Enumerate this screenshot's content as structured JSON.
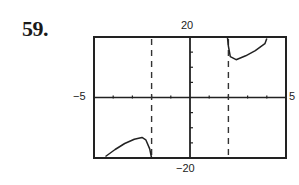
{
  "problem": {
    "number": "59."
  },
  "chart_data": {
    "type": "line",
    "title": "",
    "xlabel": "",
    "ylabel": "",
    "xlim": [
      -5,
      5
    ],
    "ylim": [
      -20,
      20
    ],
    "x_tick_labels": {
      "min": "−5",
      "max": "5"
    },
    "y_tick_labels": {
      "min": "−20",
      "max": "20"
    },
    "x_tick_step": 1,
    "y_tick_step": 5,
    "grid": false,
    "legend": null,
    "vertical_asymptotes": [
      -2,
      2
    ],
    "series": [
      {
        "name": "left branch",
        "points": [
          [
            -4.4,
            -19.5
          ],
          [
            -3.9,
            -17.2
          ],
          [
            -3.4,
            -15.2
          ],
          [
            -2.9,
            -13.8
          ],
          [
            -2.5,
            -13.2
          ],
          [
            -2.3,
            -14.0
          ],
          [
            -2.1,
            -17.0
          ],
          [
            -2.0,
            -20.0
          ]
        ]
      },
      {
        "name": "right branch",
        "points": [
          [
            1.95,
            20.0
          ],
          [
            2.0,
            17.0
          ],
          [
            2.1,
            13.5
          ],
          [
            2.4,
            12.5
          ],
          [
            2.9,
            13.8
          ],
          [
            3.4,
            15.5
          ],
          [
            3.9,
            17.8
          ],
          [
            4.0,
            19.5
          ]
        ]
      }
    ]
  }
}
